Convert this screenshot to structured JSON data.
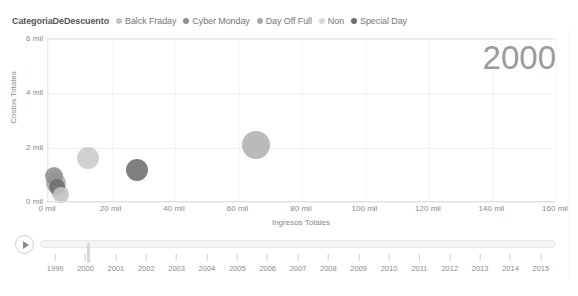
{
  "legend": {
    "title": "CategoriaDeDescuento",
    "items": [
      {
        "label": "Balck Fraday",
        "color": "#c4c4c4"
      },
      {
        "label": "Cyber Monday",
        "color": "#8f8f8f"
      },
      {
        "label": "Day Off Full",
        "color": "#a8a8a8"
      },
      {
        "label": "Non",
        "color": "#d9d9d9"
      },
      {
        "label": "Special Day",
        "color": "#6e6e6e"
      }
    ]
  },
  "watermark": {
    "year": "2000"
  },
  "timeline": {
    "play_label": "play-button",
    "selected_year": "2000",
    "years": [
      "1999",
      "2000",
      "2001",
      "2002",
      "2003",
      "2004",
      "2005",
      "2006",
      "2007",
      "2008",
      "2009",
      "2010",
      "2011",
      "2012",
      "2013",
      "2014",
      "2015"
    ]
  },
  "chart_data": {
    "type": "scatter",
    "title": "",
    "xlabel": "Ingresos Totales",
    "ylabel": "Costos Totales",
    "xlim": [
      0,
      160000
    ],
    "ylim": [
      0,
      6000
    ],
    "xtick_labels": [
      "0 mil",
      "20 mil",
      "40 mil",
      "60 mil",
      "80 mil",
      "100 mil",
      "120 mil",
      "140 mil",
      "160 mil"
    ],
    "xtick_values": [
      0,
      20000,
      40000,
      60000,
      80000,
      100000,
      120000,
      140000,
      160000
    ],
    "ytick_labels": [
      "0 mil",
      "2 mil",
      "4 mil",
      "6 mil"
    ],
    "ytick_values": [
      0,
      2000,
      4000,
      6000
    ],
    "grid": true,
    "legend_position": "top-left",
    "size_encodes": "bubble area",
    "points": [
      {
        "label": "Non",
        "x": 3500,
        "y": 400,
        "r": 9,
        "color": "#d9d9d9"
      },
      {
        "label": "Day Off Full",
        "x": 2600,
        "y": 700,
        "r": 10,
        "color": "#a8a8a8"
      },
      {
        "label": "Cyber Monday",
        "x": 2000,
        "y": 950,
        "r": 9,
        "color": "#8f8f8f"
      },
      {
        "label": "Special Day",
        "x": 2800,
        "y": 560,
        "r": 8,
        "color": "#6e6e6e"
      },
      {
        "label": "Balck Fraday",
        "x": 4200,
        "y": 260,
        "r": 8,
        "color": "#c4c4c4"
      },
      {
        "label": "Balck Fraday",
        "x": 12500,
        "y": 1620,
        "r": 11,
        "color": "#c9c9c9"
      },
      {
        "label": "Special Day",
        "x": 28000,
        "y": 1170,
        "r": 11,
        "color": "#6e6e6e"
      },
      {
        "label": "Day Off Full",
        "x": 65500,
        "y": 2090,
        "r": 14,
        "color": "#b0b0b0"
      }
    ]
  }
}
